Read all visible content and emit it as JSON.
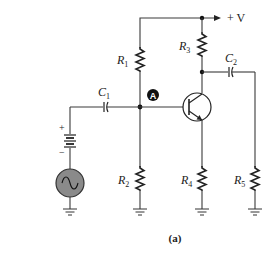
{
  "figure": {
    "caption": "(a)",
    "supply_label": "+ V",
    "node_label": "A"
  },
  "components": {
    "R1": {
      "letter": "R",
      "sub": "1"
    },
    "R2": {
      "letter": "R",
      "sub": "2"
    },
    "R3": {
      "letter": "R",
      "sub": "3"
    },
    "R4": {
      "letter": "R",
      "sub": "4"
    },
    "R5": {
      "letter": "R",
      "sub": "5"
    },
    "C1": {
      "letter": "C",
      "sub": "1"
    },
    "C2": {
      "letter": "C",
      "sub": "2"
    },
    "battery": {
      "plus": "+",
      "minus": "−"
    }
  },
  "colors": {
    "wire": "#3a3a3a",
    "ac_source_fill": "#8a8a8a",
    "node_badge": "#111111"
  }
}
